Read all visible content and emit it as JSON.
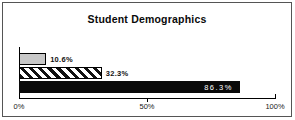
{
  "chart_data": {
    "type": "bar",
    "orientation": "horizontal",
    "title": "Student Demographics",
    "series": [
      {
        "label": "10.6%",
        "value": 10.6,
        "fill": "lightgray",
        "pattern": "solid",
        "label_placement": "outside"
      },
      {
        "label": "32.3%",
        "value": 32.3,
        "fill": "white",
        "pattern": "diagonal-hatch",
        "label_placement": "outside"
      },
      {
        "label": "86.3%",
        "value": 86.3,
        "fill": "black",
        "pattern": "solid",
        "label_placement": "inside"
      }
    ],
    "xlim": [
      0,
      100
    ],
    "x_ticks": [
      {
        "label": "0%",
        "value": 0
      },
      {
        "label": "50%",
        "value": 50
      },
      {
        "label": "100%",
        "value": 100
      }
    ],
    "grid": false,
    "legend": false,
    "colors": {
      "bar_light": "#c8c8c8",
      "bar_dark": "#0a0a0a",
      "axis": "#000000",
      "frame_border": "#555555",
      "background": "#ffffff",
      "inside_label_text": "#ffffff"
    }
  }
}
